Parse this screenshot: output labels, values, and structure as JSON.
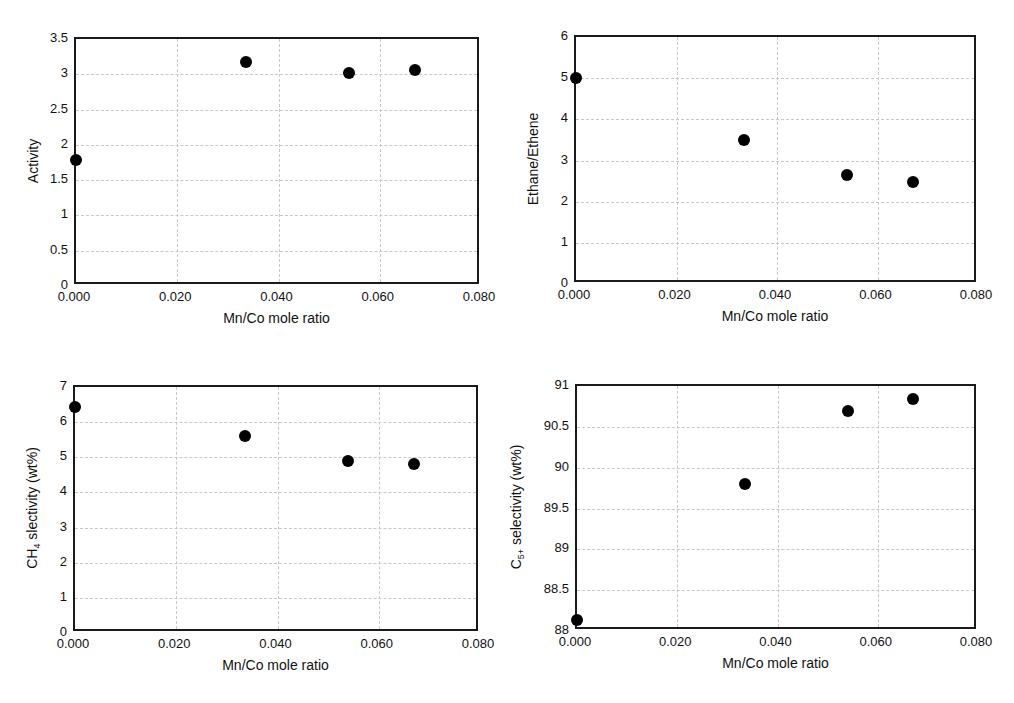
{
  "chart_data": [
    {
      "type": "scatter",
      "title": "",
      "xlabel": "Mn/Co mole ratio",
      "ylabel": "Activity",
      "ylabel_main": "Activity",
      "ylabel_sub": "",
      "ylabel_rest": "",
      "xlim": [
        0,
        0.08
      ],
      "ylim": [
        0,
        3.5
      ],
      "grid": true,
      "x_ticks": [
        "0.000",
        "0.020",
        "0.040",
        "0.060",
        "0.080"
      ],
      "y_ticks": [
        "0",
        "0.5",
        "1",
        "1.5",
        "2",
        "2.5",
        "3",
        "3.5"
      ],
      "x": [
        0.0,
        0.0335,
        0.054,
        0.067
      ],
      "y": [
        1.78,
        3.17,
        3.02,
        3.06
      ]
    },
    {
      "type": "scatter",
      "title": "",
      "xlabel": "Mn/Co mole ratio",
      "ylabel": "Ethane/Ethene",
      "ylabel_main": "Ethane/Ethene",
      "ylabel_sub": "",
      "ylabel_rest": "",
      "xlim": [
        0,
        0.08
      ],
      "ylim": [
        0,
        6
      ],
      "grid": true,
      "x_ticks": [
        "0.000",
        "0.020",
        "0.040",
        "0.060",
        "0.080"
      ],
      "y_ticks": [
        "0",
        "1",
        "2",
        "3",
        "4",
        "5",
        "6"
      ],
      "x": [
        0.0,
        0.0335,
        0.054,
        0.067
      ],
      "y": [
        5.0,
        3.5,
        2.65,
        2.47
      ]
    },
    {
      "type": "scatter",
      "title": "",
      "xlabel": "Mn/Co mole ratio",
      "ylabel": "CH4 slectivity (wt%)",
      "ylabel_main": "CH",
      "ylabel_sub": "4",
      "ylabel_rest": " slectivity (wt%)",
      "xlim": [
        0,
        0.08
      ],
      "ylim": [
        0,
        7
      ],
      "grid": true,
      "x_ticks": [
        "0.000",
        "0.020",
        "0.040",
        "0.060",
        "0.080"
      ],
      "y_ticks": [
        "0",
        "1",
        "2",
        "3",
        "4",
        "5",
        "6",
        "7"
      ],
      "x": [
        0.0,
        0.0335,
        0.054,
        0.067
      ],
      "y": [
        6.43,
        5.6,
        4.9,
        4.8
      ]
    },
    {
      "type": "scatter",
      "title": "",
      "xlabel": "Mn/Co mole ratio",
      "ylabel": "C5+ selectivity (wt%)",
      "ylabel_main": "C",
      "ylabel_sub": "5+",
      "ylabel_rest": " selectivity (wt%)",
      "xlim": [
        0,
        0.08
      ],
      "ylim": [
        88,
        91
      ],
      "grid": true,
      "x_ticks": [
        "0.000",
        "0.020",
        "0.040",
        "0.060",
        "0.080"
      ],
      "y_ticks": [
        "88",
        "88.5",
        "89",
        "89.5",
        "90",
        "90.5",
        "91"
      ],
      "x": [
        0.0,
        0.0335,
        0.054,
        0.067
      ],
      "y": [
        88.13,
        89.8,
        90.7,
        90.84
      ]
    }
  ],
  "layout": {
    "panels": [
      {
        "left": 74,
        "top": 37,
        "right": 479,
        "bottom": 284
      },
      {
        "left": 574,
        "top": 35,
        "right": 976,
        "bottom": 282
      },
      {
        "left": 73,
        "top": 385,
        "right": 478,
        "bottom": 631
      },
      {
        "left": 575,
        "top": 384,
        "right": 976,
        "bottom": 629
      }
    ],
    "marker_color": "#000000",
    "grid_color": "#c8c8c8",
    "frame_color": "#1a1a1a"
  }
}
